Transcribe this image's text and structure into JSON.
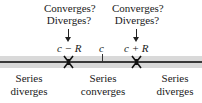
{
  "diagram": {
    "endpoint_question_left": {
      "line1": "Converges?",
      "line2": "Diverges?"
    },
    "endpoint_question_right": {
      "line1": "Converges?",
      "line2": "Diverges?"
    },
    "points": {
      "left_endpoint": "c − R",
      "center": "c",
      "right_endpoint": "c + R"
    },
    "regions": [
      {
        "line1": "Series",
        "line2": "diverges"
      },
      {
        "line1": "Series",
        "line2": "converges"
      },
      {
        "line1": "Series",
        "line2": "diverges"
      }
    ],
    "colors": {
      "band": "#d9d9d9",
      "axis": "#3a3a3a",
      "text": "#1a1a1a"
    }
  }
}
